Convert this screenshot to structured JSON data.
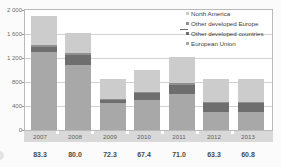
{
  "chart_data": {
    "type": "bar",
    "stacked": true,
    "title": "",
    "subtitle": "",
    "xlabel": "",
    "ylabel": "",
    "ylim": [
      0,
      2000
    ],
    "yticks": [
      0,
      400,
      800,
      1200,
      1600,
      2000
    ],
    "ytick_labels": [
      "0",
      "400",
      "800",
      "1 200",
      "1 600",
      "2 000"
    ],
    "grid": true,
    "legend_position": "top-right",
    "categories": [
      "2007",
      "2008",
      "2009",
      "2010",
      "2011",
      "2012",
      "2013"
    ],
    "series": [
      {
        "name": "European Union",
        "color": "#a8a8a8",
        "values": [
          1290,
          1080,
          440,
          490,
          590,
          300,
          290
        ]
      },
      {
        "name": "Other developed countries",
        "color": "#6e6e6e",
        "values": [
          80,
          160,
          60,
          120,
          160,
          150,
          150
        ]
      },
      {
        "name": "Other developed Europe",
        "color": "#8f8f8f",
        "values": [
          40,
          30,
          20,
          20,
          20,
          20,
          20
        ]
      },
      {
        "name": "North America",
        "color": "#cccccc",
        "values": [
          480,
          330,
          320,
          360,
          440,
          370,
          390
        ]
      }
    ],
    "totals": [
      1890,
      1600,
      840,
      990,
      1210,
      840,
      850
    ],
    "footer_values": [
      "83.3",
      "80.0",
      "72.3",
      "67.4",
      "71.0",
      "63.3",
      "60.8"
    ]
  },
  "legend": {
    "items": [
      {
        "label": "North America",
        "color": "#cccccc"
      },
      {
        "label": "Other developed Europe",
        "color": "#8f8f8f"
      },
      {
        "label": "Other developed countries",
        "color": "#6e6e6e"
      },
      {
        "label": "European Union",
        "color": "#a8a8a8"
      }
    ]
  },
  "colors": {
    "plot_background": "#ffffff",
    "page_background": "#fbfbfb",
    "gridline": "#d2d2d2",
    "frame": "#b9b9b9",
    "axis_band": "#d9d9d9",
    "tick_text": "#6b6b6b",
    "footer_text": "#4a4a4a"
  }
}
